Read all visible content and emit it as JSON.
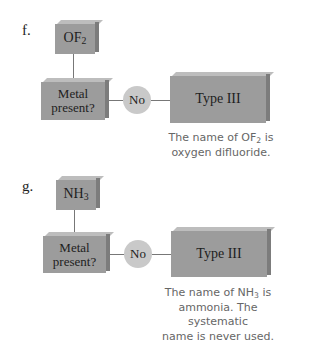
{
  "sections": [
    {
      "label": "f.",
      "compound": {
        "base": "OF",
        "sub": "2"
      },
      "decision": "Metal present?",
      "answer": "No",
      "result": "Type III",
      "caption": {
        "prefix": "The name of OF",
        "sub": "2",
        "suffix": " is",
        "rest": "oxygen difluoride."
      }
    },
    {
      "label": "g.",
      "compound": {
        "base": "NH",
        "sub": "3"
      },
      "decision": "Metal present?",
      "answer": "No",
      "result": "Type III",
      "caption": {
        "prefix": "The name of NH",
        "sub": "3",
        "suffix": " is",
        "rest": "ammonia. The systematic\nname is never used."
      }
    }
  ],
  "colors": {
    "box": "#9c9c9c",
    "circle": "#c9c9c9",
    "caption": "#666666"
  }
}
